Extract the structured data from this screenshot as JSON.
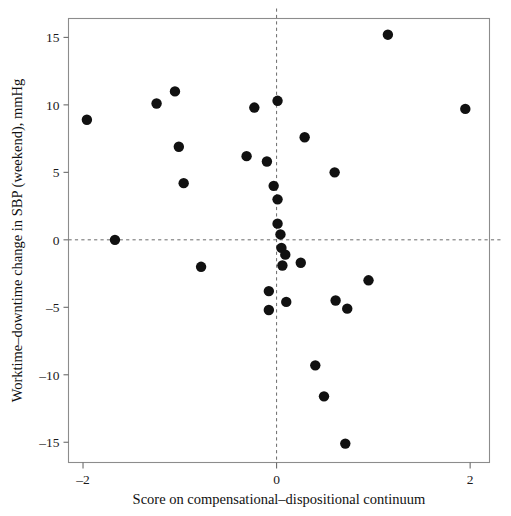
{
  "figure": {
    "kind": "scatter-plot",
    "background": "#ffffff",
    "frame_color": "#8c8c8c",
    "point_color": "#111111",
    "reference_line_color": "#6b6b6b"
  },
  "chart_data": {
    "type": "scatter",
    "title": "",
    "xlabel": "Score on compensational–dispositional continuum",
    "ylabel": "Worktime–downtime change in SBP (weekend), mmHg",
    "xlim": [
      -2.15,
      2.2
    ],
    "ylim": [
      -16.5,
      16.4
    ],
    "xticks": [
      -2,
      0,
      2
    ],
    "xticklabels": [
      "–2",
      "0",
      "2"
    ],
    "yticks": [
      15,
      10,
      5,
      0,
      -5,
      -10,
      -15
    ],
    "yticklabels": [
      "15",
      "10",
      "5",
      "0",
      "–5",
      "–10",
      "–15"
    ],
    "grid": false,
    "legend": null,
    "reference_lines": [
      {
        "axis": "y",
        "value": 0,
        "style": "dashed"
      },
      {
        "axis": "x",
        "value": 0,
        "style": "dashed"
      }
    ],
    "marker": {
      "shape": "circle",
      "size": 5.2,
      "color": "#111111"
    },
    "points": [
      {
        "x": -1.96,
        "y": 8.9
      },
      {
        "x": -1.67,
        "y": 0.0
      },
      {
        "x": -1.24,
        "y": 10.1
      },
      {
        "x": -1.05,
        "y": 11.0
      },
      {
        "x": -0.96,
        "y": 4.2
      },
      {
        "x": -1.01,
        "y": 6.9
      },
      {
        "x": -0.78,
        "y": -2.0
      },
      {
        "x": -0.31,
        "y": 6.2
      },
      {
        "x": -0.23,
        "y": 9.8
      },
      {
        "x": -0.1,
        "y": 5.8
      },
      {
        "x": -0.08,
        "y": -5.2
      },
      {
        "x": -0.03,
        "y": 4.0
      },
      {
        "x": -0.08,
        "y": -3.8
      },
      {
        "x": 0.01,
        "y": 10.3
      },
      {
        "x": 0.01,
        "y": 3.0
      },
      {
        "x": 0.01,
        "y": 1.2
      },
      {
        "x": 0.04,
        "y": 0.4
      },
      {
        "x": 0.05,
        "y": -0.6
      },
      {
        "x": 0.09,
        "y": -1.1
      },
      {
        "x": 0.06,
        "y": -1.9
      },
      {
        "x": 0.1,
        "y": -4.6
      },
      {
        "x": 0.29,
        "y": 7.6
      },
      {
        "x": 0.25,
        "y": -1.7
      },
      {
        "x": 0.6,
        "y": 5.0
      },
      {
        "x": 0.61,
        "y": -4.5
      },
      {
        "x": 0.73,
        "y": -5.1
      },
      {
        "x": 0.95,
        "y": -3.0
      },
      {
        "x": 0.4,
        "y": -9.3
      },
      {
        "x": 0.49,
        "y": -11.6
      },
      {
        "x": 0.71,
        "y": -15.1
      },
      {
        "x": 1.15,
        "y": 15.2
      },
      {
        "x": 1.95,
        "y": 9.7
      }
    ]
  }
}
